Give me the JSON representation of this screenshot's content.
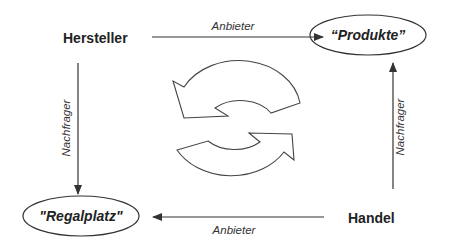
{
  "diagram": {
    "nodes": {
      "hersteller": "Hersteller",
      "handel": "Handel",
      "produkte": "“Produkte”",
      "regalplatz": "\"Regalplatz\""
    },
    "edges": {
      "top": "Anbieter",
      "bottom": "Anbieter",
      "left": "Nachfrager",
      "right": "Nachfrager"
    },
    "center_icon": "cycle-arrows-icon",
    "colors": {
      "line": "#333333",
      "text": "#222222",
      "background": "#ffffff"
    }
  }
}
